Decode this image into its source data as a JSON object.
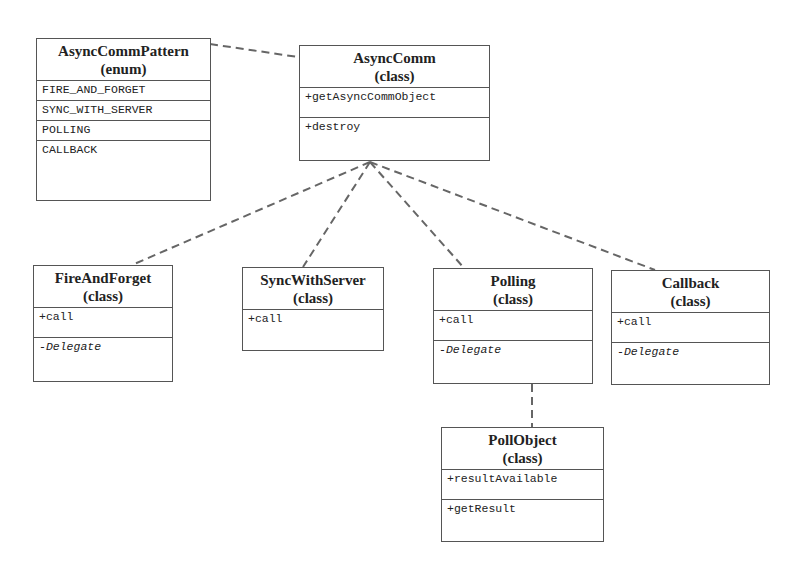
{
  "diagram": {
    "type": "uml-class-diagram",
    "classes": {
      "pattern": {
        "name": "AsyncCommPattern",
        "stereotype": "(enum)",
        "members": [
          "FIRE_AND_FORGET",
          "SYNC_WITH_SERVER",
          "POLLING",
          "CALLBACK"
        ]
      },
      "asynccomm": {
        "name": "AsyncComm",
        "stereotype": "(class)",
        "methods": [
          "+getAsyncCommObject"
        ],
        "extra": [
          "+destroy"
        ]
      },
      "fireandforget": {
        "name": "FireAndForget",
        "stereotype": "(class)",
        "methods": [
          "+call"
        ],
        "attributes": [
          "-Delegate"
        ]
      },
      "syncwithserver": {
        "name": "SyncWithServer",
        "stereotype": "(class)",
        "methods": [
          "+call"
        ]
      },
      "polling": {
        "name": "Polling",
        "stereotype": "(class)",
        "methods": [
          "+call"
        ],
        "attributes": [
          "-Delegate"
        ]
      },
      "callback": {
        "name": "Callback",
        "stereotype": "(class)",
        "methods": [
          "+call"
        ],
        "attributes": [
          "-Delegate"
        ]
      },
      "pollobject": {
        "name": "PollObject",
        "stereotype": "(class)",
        "methods": [
          "+resultAvailable"
        ],
        "extra": [
          "+getResult"
        ]
      }
    },
    "relations": [
      {
        "from": "AsyncCommPattern",
        "to": "AsyncComm",
        "style": "dashed"
      },
      {
        "from": "AsyncComm",
        "to": "FireAndForget",
        "style": "dashed"
      },
      {
        "from": "AsyncComm",
        "to": "SyncWithServer",
        "style": "dashed"
      },
      {
        "from": "AsyncComm",
        "to": "Polling",
        "style": "dashed"
      },
      {
        "from": "AsyncComm",
        "to": "Callback",
        "style": "dashed"
      },
      {
        "from": "Polling",
        "to": "PollObject",
        "style": "dashed"
      }
    ]
  }
}
